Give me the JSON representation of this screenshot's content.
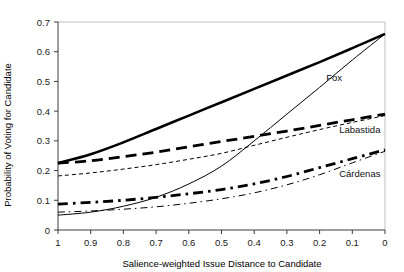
{
  "chart_data": {
    "type": "line",
    "title": "",
    "xlabel": "Salience-weighted Issue Distance to Candidate",
    "ylabel": "Probability of Voting for Candidate",
    "xlim": [
      1,
      0
    ],
    "ylim": [
      0,
      0.7
    ],
    "x_reversed": true,
    "grid": false,
    "legend_position": "inline-right-annotations",
    "xticks": [
      "1",
      "0.9",
      "0.8",
      "0.7",
      "0.6",
      "0.5",
      "0.4",
      "0.3",
      "0.2",
      "0.1",
      "0"
    ],
    "xtick_values": [
      1,
      0.9,
      0.8,
      0.7,
      0.6,
      0.5,
      0.4,
      0.3,
      0.2,
      0.1,
      0
    ],
    "yticks": [
      "0",
      "0.1",
      "0.2",
      "0.3",
      "0.4",
      "0.5",
      "0.6",
      "0.7"
    ],
    "ytick_values": [
      0,
      0.1,
      0.2,
      0.3,
      0.4,
      0.5,
      0.6,
      0.7
    ],
    "x": [
      1,
      0.9,
      0.8,
      0.7,
      0.6,
      0.5,
      0.4,
      0.3,
      0.2,
      0.1,
      0
    ],
    "series": [
      {
        "name": "Fox (thick solid)",
        "candidate": "Fox",
        "style": "solid",
        "width": "thick",
        "color": "#000000",
        "values": [
          0.225,
          0.255,
          0.295,
          0.34,
          0.385,
          0.43,
          0.475,
          0.52,
          0.565,
          0.612,
          0.66
        ]
      },
      {
        "name": "Fox (thin solid)",
        "candidate": "Fox",
        "style": "solid",
        "width": "thin",
        "color": "#000000",
        "values": [
          0.05,
          0.06,
          0.08,
          0.11,
          0.155,
          0.215,
          0.3,
          0.39,
          0.48,
          0.572,
          0.66
        ]
      },
      {
        "name": "Labastida (thick long-dash)",
        "candidate": "Labastida",
        "style": "long-dash",
        "width": "thick",
        "color": "#000000",
        "values": [
          0.225,
          0.233,
          0.247,
          0.262,
          0.28,
          0.298,
          0.315,
          0.333,
          0.352,
          0.371,
          0.39
        ]
      },
      {
        "name": "Labastida (thin short-dash)",
        "candidate": "Labastida",
        "style": "short-dash",
        "width": "thin",
        "color": "#000000",
        "values": [
          0.182,
          0.192,
          0.205,
          0.22,
          0.238,
          0.258,
          0.285,
          0.312,
          0.338,
          0.362,
          0.385
        ]
      },
      {
        "name": "Cardenas (thick dash-dot)",
        "candidate": "Cárdenas",
        "style": "dash-dot",
        "width": "thick",
        "color": "#000000",
        "values": [
          0.087,
          0.093,
          0.1,
          0.11,
          0.122,
          0.136,
          0.155,
          0.18,
          0.21,
          0.24,
          0.27
        ]
      },
      {
        "name": "Cardenas (thin dash-dot)",
        "candidate": "Cárdenas",
        "style": "dash-dot",
        "width": "thin",
        "color": "#000000",
        "values": [
          0.06,
          0.064,
          0.07,
          0.078,
          0.09,
          0.105,
          0.125,
          0.152,
          0.186,
          0.226,
          0.265
        ]
      }
    ],
    "annotations": [
      {
        "text": "Fox",
        "x": 0.18,
        "y": 0.5
      },
      {
        "text": "Labastida",
        "x": 0.14,
        "y": 0.325
      },
      {
        "text": "Cárdenas",
        "x": 0.14,
        "y": 0.178
      }
    ]
  }
}
